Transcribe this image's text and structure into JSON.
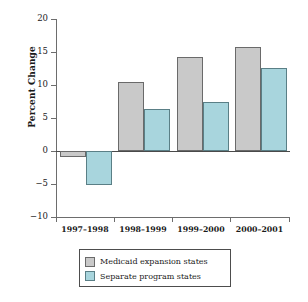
{
  "chart_data": {
    "type": "bar",
    "title": "",
    "subtitle": "",
    "xlabel": "",
    "ylabel": "Percent Change",
    "categories": [
      "1997–1998",
      "1998–1999",
      "1999–2000",
      "2000–2001"
    ],
    "series": [
      {
        "name": "Medicaid expansion states",
        "color": "#c9c9c9",
        "values": [
          -0.9,
          10.4,
          14.2,
          15.7
        ]
      },
      {
        "name": "Separate program states",
        "color": "#a8d5dd",
        "values": [
          -5.2,
          6.3,
          7.5,
          12.6
        ]
      }
    ],
    "ylim": [
      -10,
      20
    ],
    "yticks": [
      20,
      15,
      10,
      5,
      0,
      -5,
      -10
    ],
    "ytick_labels": [
      "20",
      "15",
      "10",
      "5",
      "0",
      "−5",
      "−10"
    ],
    "grid": false,
    "legend_position": "bottom",
    "zero_line": true
  },
  "legend": {
    "entries": [
      {
        "label": "Medicaid expansion states",
        "swatch": "gray-swatch"
      },
      {
        "label": "Separate program states",
        "swatch": "teal-swatch"
      }
    ]
  }
}
